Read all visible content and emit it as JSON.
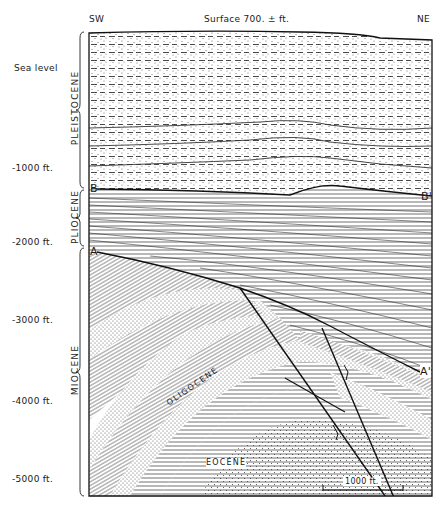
{
  "header": {
    "left_label": "SW",
    "center_label": "Surface 700. ± ft.",
    "right_label": "NE"
  },
  "depth_axis": [
    {
      "label": "Sea level",
      "y": 68
    },
    {
      "label": "-1000 ft.",
      "y": 168
    },
    {
      "label": "-2000 ft.",
      "y": 240
    },
    {
      "label": "-3000 ft.",
      "y": 318
    },
    {
      "label": "-4000 ft.",
      "y": 400
    },
    {
      "label": "-5000 ft.",
      "y": 478
    }
  ],
  "epochs": [
    {
      "name": "PLEISTOCENE",
      "top": 30,
      "bottom": 188
    },
    {
      "name": "PLIOCENE",
      "top": 190,
      "bottom": 246
    },
    {
      "name": "MIOCENE",
      "top": 248,
      "bottom": 496
    }
  ],
  "markers": {
    "b_left": "B",
    "b_right": "B'",
    "a_left": "A",
    "a_right": "A'"
  },
  "formation_labels": {
    "oligocene": "OLIGOCENE",
    "eocene": "EOCENE"
  },
  "scale_bar": {
    "label": "1000 ft."
  },
  "colors": {
    "ink": "#1a1a1a",
    "paper": "#ffffff"
  }
}
